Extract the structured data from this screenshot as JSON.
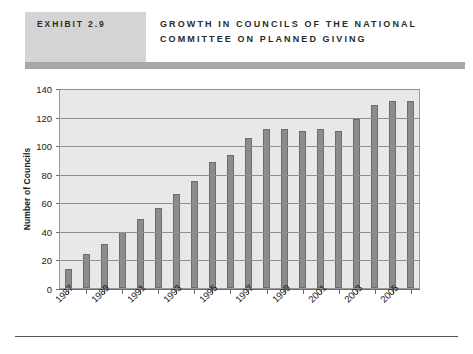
{
  "header": {
    "exhibit_label": "EXHIBIT 2.9",
    "title": "GROWTH IN COUNCILS OF THE NATIONAL COMMITTEE ON PLANNED GIVING",
    "badge_color": "#d4d4d4",
    "rule_color": "#a8a8a8"
  },
  "chart_data": {
    "type": "bar",
    "title": "GROWTH IN COUNCILS OF THE NATIONAL COMMITTEE ON PLANNED GIVING",
    "xlabel": "",
    "ylabel": "Number of Councils",
    "ylim": [
      0,
      140
    ],
    "yticks": [
      0,
      20,
      40,
      60,
      80,
      100,
      120,
      140
    ],
    "grid": true,
    "legend": "none",
    "bar_color": "#8c8c8c",
    "plot_background": "#e8e8e8",
    "categories": [
      "1987",
      "1988",
      "1989",
      "1990",
      "1991",
      "1992",
      "1993",
      "1994",
      "1995",
      "1996",
      "1997",
      "1998",
      "1999",
      "2000",
      "2001",
      "2002",
      "2003",
      "2004",
      "2005",
      "2006"
    ],
    "tick_labels": [
      "1987",
      "",
      "1989",
      "",
      "1991",
      "",
      "1993",
      "",
      "1995",
      "",
      "1997",
      "",
      "1999",
      "",
      "2001",
      "",
      "2003",
      "",
      "2005",
      ""
    ],
    "values": [
      13,
      24,
      31,
      39,
      48,
      56,
      66,
      75,
      88,
      93,
      105,
      111,
      111,
      110,
      111,
      110,
      118,
      128,
      131,
      131
    ]
  }
}
